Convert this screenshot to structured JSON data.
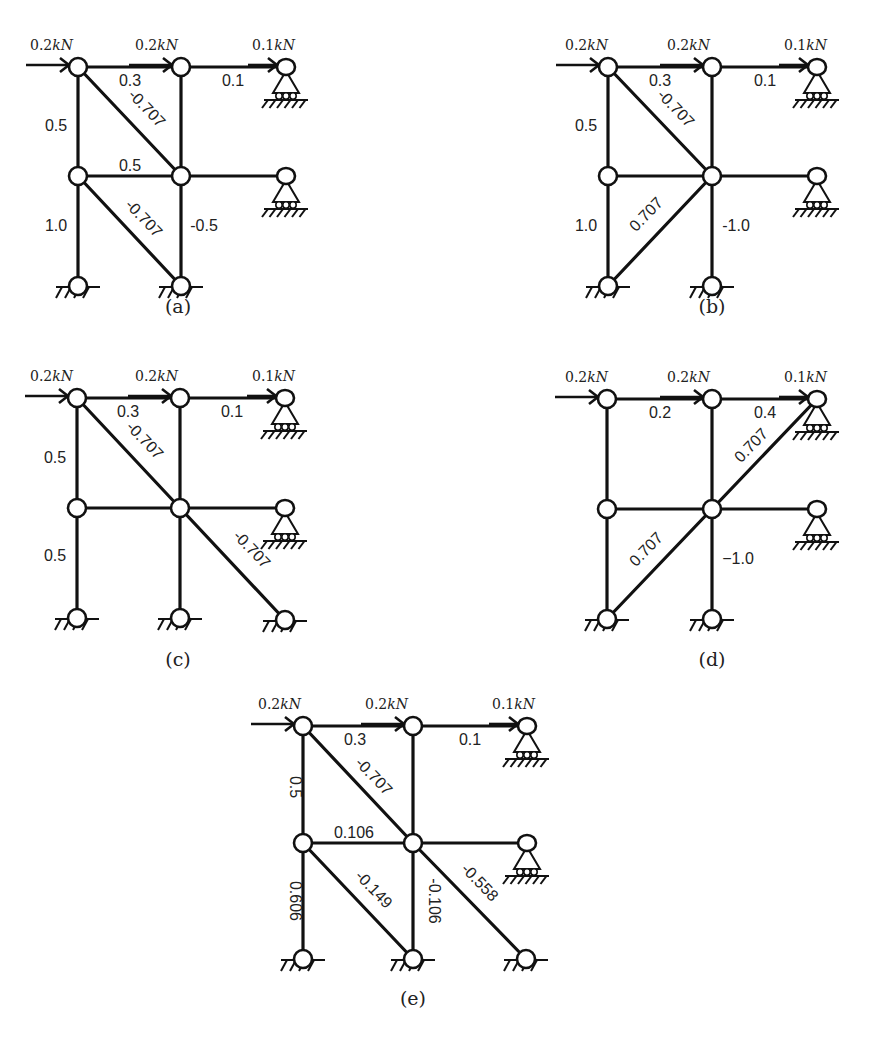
{
  "figure": {
    "panels": [
      {
        "id": "a",
        "caption": "(a)",
        "caption_pos": [
          178,
          313
        ],
        "cols": [
          78,
          181
        ],
        "rows": [
          67,
          176,
          286
        ],
        "support_x": 286,
        "extra_bottom_support": false,
        "loads": [
          {
            "label": "0.2kN",
            "node": [
              78,
              67
            ],
            "label_pos": [
              30,
              50
            ],
            "arrow_len": 42
          },
          {
            "label": "0.2kN",
            "node": [
              181,
              67
            ],
            "label_pos": [
              135,
              50
            ],
            "arrow_len": 42
          },
          {
            "label": "0.1kN",
            "node": [
              286,
              67
            ],
            "label_pos": [
              252,
              50
            ],
            "arrow_len": 28
          }
        ],
        "diagonals": [
          {
            "from": [
              78,
              67
            ],
            "to": [
              181,
              176
            ]
          },
          {
            "from": [
              78,
              176
            ],
            "to": [
              181,
              286
            ]
          }
        ],
        "labels": [
          {
            "text": "0.3",
            "x": 130,
            "y": 86,
            "rotate": 0
          },
          {
            "text": "0.1",
            "x": 233,
            "y": 86,
            "rotate": 0
          },
          {
            "text": "0.5",
            "x": 56,
            "y": 131,
            "rotate": 0
          },
          {
            "text": "-0.707",
            "x": 143,
            "y": 112,
            "rotate": 46
          },
          {
            "text": "0.5",
            "x": 130,
            "y": 171,
            "rotate": 0
          },
          {
            "text": "1.0",
            "x": 56,
            "y": 231,
            "rotate": 0
          },
          {
            "text": "-0.707",
            "x": 140,
            "y": 222,
            "rotate": 46
          },
          {
            "text": "-0.5",
            "x": 204,
            "y": 231,
            "rotate": 0
          }
        ]
      },
      {
        "id": "b",
        "caption": "(b)",
        "caption_pos": [
          712,
          313
        ],
        "cols": [
          608,
          712
        ],
        "rows": [
          67,
          176,
          286
        ],
        "support_x": 817,
        "extra_bottom_support": false,
        "loads": [
          {
            "label": "0.2kN",
            "node": [
              608,
              67
            ],
            "label_pos": [
              565,
              50
            ],
            "arrow_len": 42
          },
          {
            "label": "0.2kN",
            "node": [
              712,
              67
            ],
            "label_pos": [
              667,
              50
            ],
            "arrow_len": 42
          },
          {
            "label": "0.1kN",
            "node": [
              817,
              67
            ],
            "label_pos": [
              784,
              50
            ],
            "arrow_len": 28
          }
        ],
        "diagonals": [
          {
            "from": [
              608,
              67
            ],
            "to": [
              712,
              176
            ]
          },
          {
            "from": [
              608,
              286
            ],
            "to": [
              712,
              176
            ]
          }
        ],
        "labels": [
          {
            "text": "0.3",
            "x": 660,
            "y": 86,
            "rotate": 0
          },
          {
            "text": "0.1",
            "x": 765,
            "y": 86,
            "rotate": 0
          },
          {
            "text": "0.5",
            "x": 586,
            "y": 131,
            "rotate": 0
          },
          {
            "text": "-0.707",
            "x": 672,
            "y": 112,
            "rotate": 46
          },
          {
            "text": "1.0",
            "x": 586,
            "y": 231,
            "rotate": 0
          },
          {
            "text": "0.707",
            "x": 650,
            "y": 218,
            "rotate": -46
          },
          {
            "text": "-1.0",
            "x": 736,
            "y": 231,
            "rotate": 0
          }
        ]
      },
      {
        "id": "c",
        "caption": "(c)",
        "caption_pos": [
          178,
          666
        ],
        "cols": [
          77,
          180
        ],
        "rows": [
          398,
          508,
          618
        ],
        "support_x": 285,
        "extra_bottom_support": true,
        "loads": [
          {
            "label": "0.2kN",
            "node": [
              77,
              398
            ],
            "label_pos": [
              30,
              381
            ],
            "arrow_len": 42
          },
          {
            "label": "0.2kN",
            "node": [
              180,
              398
            ],
            "label_pos": [
              135,
              381
            ],
            "arrow_len": 42
          },
          {
            "label": "0.1kN",
            "node": [
              285,
              398
            ],
            "label_pos": [
              252,
              381
            ],
            "arrow_len": 28
          }
        ],
        "diagonals": [
          {
            "from": [
              77,
              398
            ],
            "to": [
              180,
              508
            ]
          },
          {
            "from": [
              180,
              508
            ],
            "to": [
              285,
              620
            ]
          }
        ],
        "labels": [
          {
            "text": "0.3",
            "x": 128,
            "y": 417,
            "rotate": 0
          },
          {
            "text": "0.1",
            "x": 232,
            "y": 417,
            "rotate": 0
          },
          {
            "text": "0.5",
            "x": 55,
            "y": 463,
            "rotate": 0
          },
          {
            "text": "-0.707",
            "x": 141,
            "y": 444,
            "rotate": 46
          },
          {
            "text": "0.5",
            "x": 55,
            "y": 561,
            "rotate": 0
          },
          {
            "text": "-0.707",
            "x": 248,
            "y": 553,
            "rotate": 46
          }
        ]
      },
      {
        "id": "d",
        "caption": "(d)",
        "caption_pos": [
          712,
          666
        ],
        "cols": [
          607,
          712
        ],
        "rows": [
          399,
          509,
          619
        ],
        "support_x": 817,
        "extra_bottom_support": false,
        "loads": [
          {
            "label": "0.2kN",
            "node": [
              607,
              399
            ],
            "label_pos": [
              565,
              382
            ],
            "arrow_len": 42
          },
          {
            "label": "0.2kN",
            "node": [
              712,
              399
            ],
            "label_pos": [
              667,
              382
            ],
            "arrow_len": 42
          },
          {
            "label": "0.1kN",
            "node": [
              817,
              399
            ],
            "label_pos": [
              784,
              382
            ],
            "arrow_len": 28
          }
        ],
        "diagonals": [
          {
            "from": [
              607,
              619
            ],
            "to": [
              712,
              509
            ]
          },
          {
            "from": [
              712,
              509
            ],
            "to": [
              817,
              399
            ]
          }
        ],
        "labels": [
          {
            "text": "0.2",
            "x": 660,
            "y": 418,
            "rotate": 0
          },
          {
            "text": "0.4",
            "x": 765,
            "y": 418,
            "rotate": 0
          },
          {
            "text": "0.707",
            "x": 755,
            "y": 449,
            "rotate": -46
          },
          {
            "text": "0.707",
            "x": 650,
            "y": 553,
            "rotate": -46
          },
          {
            "text": "−1.0",
            "x": 738,
            "y": 564,
            "rotate": 0
          }
        ]
      },
      {
        "id": "e",
        "caption": "(e)",
        "caption_pos": [
          413,
          1005
        ],
        "cols": [
          303,
          413
        ],
        "rows": [
          726,
          843,
          959
        ],
        "support_x": 527,
        "extra_bottom_support": true,
        "loads": [
          {
            "label": "0.2kN",
            "node": [
              303,
              726
            ],
            "label_pos": [
              258,
              709
            ],
            "arrow_len": 42
          },
          {
            "label": "0.2kN",
            "node": [
              413,
              726
            ],
            "label_pos": [
              365,
              709
            ],
            "arrow_len": 42
          },
          {
            "label": "0.1kN",
            "node": [
              527,
              726
            ],
            "label_pos": [
              492,
              709
            ],
            "arrow_len": 28
          }
        ],
        "diagonals": [
          {
            "from": [
              303,
              726
            ],
            "to": [
              413,
              843
            ]
          },
          {
            "from": [
              303,
              843
            ],
            "to": [
              413,
              959
            ]
          },
          {
            "from": [
              413,
              843
            ],
            "to": [
              526,
              959
            ]
          }
        ],
        "labels": [
          {
            "text": "0.3",
            "x": 355,
            "y": 745,
            "rotate": 0
          },
          {
            "text": "0.1",
            "x": 470,
            "y": 745,
            "rotate": 0
          },
          {
            "text": "0.5",
            "x": 290,
            "y": 787,
            "rotate": 90
          },
          {
            "text": "-0.707",
            "x": 370,
            "y": 780,
            "rotate": 46
          },
          {
            "text": "0.106",
            "x": 354,
            "y": 838,
            "rotate": 0
          },
          {
            "text": "0.606",
            "x": 290,
            "y": 901,
            "rotate": 90
          },
          {
            "text": "-0.149",
            "x": 370,
            "y": 893,
            "rotate": 46
          },
          {
            "text": "-0.106",
            "x": 429,
            "y": 901,
            "rotate": 90
          },
          {
            "text": "-0.558",
            "x": 476,
            "y": 886,
            "rotate": 46
          }
        ]
      }
    ]
  }
}
